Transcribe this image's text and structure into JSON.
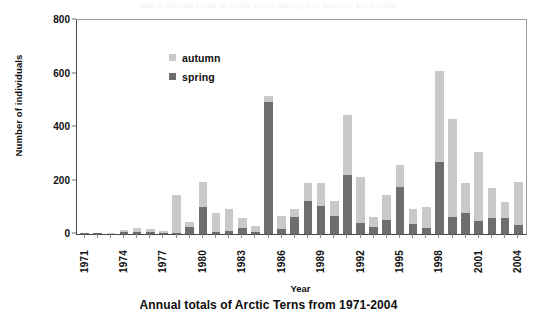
{
  "top_cropped_text": "aph 2.  Annual totals of Arctic Terns, spring and autumn, 1971-2004",
  "caption": "Annual totals of Arctic Terns from 1971-2004",
  "legend": {
    "position": "top-left-inside",
    "entries": [
      {
        "label": "autumn",
        "color": "#c9c9c9"
      },
      {
        "label": "spring",
        "color": "#6e6e6e"
      }
    ]
  },
  "chart_data": {
    "type": "bar",
    "stacked": true,
    "title": "Annual totals of Arctic Terns from 1971-2004",
    "xlabel": "Year",
    "ylabel": "Number of individuals",
    "ylim": [
      0,
      800
    ],
    "yticks": [
      0,
      200,
      400,
      600,
      800
    ],
    "grid": false,
    "tick_label_interval": 3,
    "categories": [
      "1971",
      "1972",
      "1973",
      "1974",
      "1975",
      "1976",
      "1977",
      "1978",
      "1979",
      "1980",
      "1981",
      "1982",
      "1983",
      "1984",
      "1985",
      "1986",
      "1987",
      "1988",
      "1989",
      "1990",
      "1991",
      "1992",
      "1993",
      "1994",
      "1995",
      "1996",
      "1997",
      "1998",
      "1999",
      "2000",
      "2001",
      "2002",
      "2003",
      "2004"
    ],
    "tick_labels": [
      "1971",
      "",
      "",
      "1974",
      "",
      "",
      "1977",
      "",
      "",
      "1980",
      "",
      "",
      "1983",
      "",
      "",
      "1986",
      "",
      "",
      "1989",
      "",
      "",
      "1992",
      "",
      "",
      "1995",
      "",
      "",
      "1998",
      "",
      "",
      "2001",
      "",
      "",
      "2004"
    ],
    "series": [
      {
        "name": "spring",
        "color": "#6e6e6e",
        "values": [
          2,
          2,
          0,
          8,
          6,
          8,
          4,
          5,
          28,
          100,
          8,
          10,
          22,
          6,
          495,
          20,
          65,
          122,
          105,
          67,
          221,
          40,
          26,
          52,
          174,
          38,
          22,
          268,
          64,
          78,
          47,
          60,
          60,
          33
        ]
      },
      {
        "name": "autumn",
        "color": "#c9c9c9",
        "values": [
          0,
          0,
          2,
          8,
          17,
          11,
          7,
          140,
          17,
          93,
          72,
          84,
          39,
          25,
          20,
          46,
          28,
          70,
          85,
          57,
          223,
          172,
          39,
          92,
          85,
          55,
          80,
          342,
          366,
          113,
          260,
          112,
          61,
          163
        ]
      }
    ],
    "totals": [
      2,
      2,
      2,
      16,
      23,
      19,
      11,
      145,
      45,
      193,
      80,
      94,
      61,
      31,
      515,
      66,
      93,
      192,
      190,
      124,
      444,
      212,
      65,
      144,
      259,
      93,
      102,
      610,
      430,
      191,
      307,
      172,
      121,
      196
    ]
  }
}
